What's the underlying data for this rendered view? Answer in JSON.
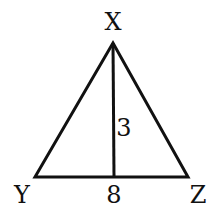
{
  "diagram": {
    "type": "triangle-with-altitude",
    "vertices": {
      "X": {
        "label": "X",
        "x": 113,
        "y": 43,
        "label_x": 113,
        "label_y": 22
      },
      "Y": {
        "label": "Y",
        "x": 35,
        "y": 177,
        "label_x": 22,
        "label_y": 195
      },
      "Z": {
        "label": "Z",
        "x": 188,
        "y": 177,
        "label_x": 198,
        "label_y": 195
      }
    },
    "altitude": {
      "from": "X",
      "foot_x": 114,
      "foot_y": 177,
      "length_label": "3",
      "label_x": 123,
      "label_y": 128
    },
    "base": {
      "from": "Y",
      "to": "Z",
      "length_label": "8",
      "label_x": 114,
      "label_y": 195
    },
    "stroke_color": "#111111",
    "stroke_width": 3
  }
}
